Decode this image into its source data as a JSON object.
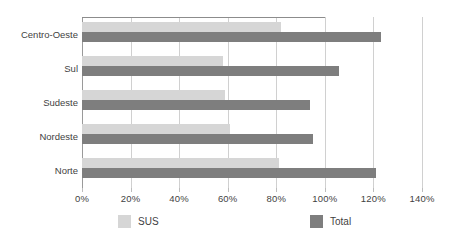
{
  "chart_data": {
    "type": "bar",
    "orientation": "horizontal",
    "title": "",
    "subtitle": "",
    "xlabel": "",
    "ylabel": "",
    "categories": [
      "Centro-Oeste",
      "Sul",
      "Sudeste",
      "Nordeste",
      "Norte"
    ],
    "series": [
      {
        "name": "SUS",
        "color": "#d6d6d6",
        "values": [
          82,
          58,
          59,
          61,
          81
        ]
      },
      {
        "name": "Total",
        "color": "#7e7e7e",
        "values": [
          123,
          106,
          94,
          95,
          121
        ]
      }
    ],
    "xlim": [
      0,
      140
    ],
    "xticks": [
      0,
      20,
      40,
      60,
      80,
      100,
      120,
      140
    ],
    "xtick_labels": [
      "0%",
      "20%",
      "40%",
      "60%",
      "80%",
      "100%",
      "120%",
      "140%"
    ],
    "value_unit": "%",
    "grid": "vertical",
    "legend_position": "bottom",
    "legend": [
      {
        "label": "SUS",
        "color": "#d6d6d6"
      },
      {
        "label": "Total",
        "color": "#7e7e7e"
      }
    ],
    "annotations": []
  },
  "colors": {
    "sus": "#d6d6d6",
    "total": "#7e7e7e",
    "gridline": "#d0d0d0",
    "axis": "#9a9a9a",
    "text": "#3f3f3f",
    "background": "#ffffff"
  }
}
